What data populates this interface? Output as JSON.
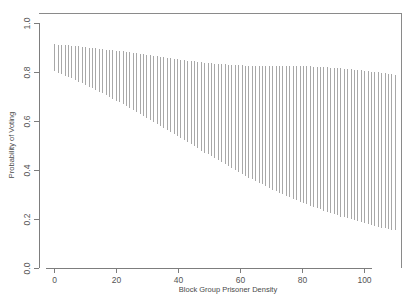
{
  "chart_data": {
    "type": "line",
    "render_style": "vertical-interval-bars",
    "title": "",
    "subtitle": "",
    "xlabel": "Block Group Prisoner Density",
    "ylabel": "Probability of Voting",
    "xlim": [
      -5,
      112
    ],
    "ylim": [
      0.0,
      1.04
    ],
    "grid": false,
    "legend": null,
    "annotations": [],
    "xticks": [
      0,
      20,
      40,
      60,
      80,
      100
    ],
    "xtick_labels": [
      "0",
      "20",
      "40",
      "60",
      "80",
      "100"
    ],
    "yticks": [
      0.0,
      0.2,
      0.4,
      0.6,
      0.8,
      1.0
    ],
    "ytick_labels": [
      "0.0",
      "0.2",
      "0.4",
      "0.6",
      "0.8",
      "1.0"
    ],
    "series": [
      {
        "name": "upper",
        "x": [
          0.0,
          1.1,
          2.2,
          3.3,
          4.4,
          5.5,
          6.6,
          7.7,
          8.8,
          9.9,
          11.0,
          12.1,
          13.2,
          14.3,
          15.4,
          16.5,
          17.6,
          18.7,
          19.8,
          20.9,
          22.0,
          23.1,
          24.2,
          25.3,
          26.4,
          27.5,
          28.6,
          29.7,
          30.8,
          31.9,
          33.0,
          34.1,
          35.2,
          36.3,
          37.4,
          38.5,
          39.6,
          40.7,
          41.8,
          42.9,
          44.0,
          45.1,
          46.2,
          47.3,
          48.4,
          49.5,
          50.6,
          51.7,
          52.8,
          53.9,
          55.0,
          56.1,
          57.2,
          58.3,
          59.4,
          60.5,
          61.6,
          62.7,
          63.8,
          64.9,
          66.0,
          67.1,
          68.2,
          69.3,
          70.4,
          71.5,
          72.6,
          73.7,
          74.8,
          75.9,
          77.0,
          78.1,
          79.2,
          80.3,
          81.4,
          82.5,
          83.6,
          84.7,
          85.8,
          86.9,
          88.0,
          89.1,
          90.2,
          91.3,
          92.4,
          93.5,
          94.6,
          95.7,
          96.8,
          97.9,
          99.0,
          100.1,
          101.2,
          102.3,
          103.4,
          104.5,
          105.6,
          106.7,
          107.8,
          108.9,
          110.0
        ],
        "values": [
          0.912,
          0.911,
          0.91,
          0.909,
          0.908,
          0.906,
          0.905,
          0.904,
          0.902,
          0.901,
          0.899,
          0.898,
          0.896,
          0.895,
          0.893,
          0.891,
          0.89,
          0.888,
          0.886,
          0.885,
          0.883,
          0.881,
          0.879,
          0.877,
          0.876,
          0.874,
          0.872,
          0.87,
          0.868,
          0.866,
          0.864,
          0.862,
          0.86,
          0.858,
          0.856,
          0.854,
          0.852,
          0.85,
          0.848,
          0.846,
          0.845,
          0.843,
          0.841,
          0.839,
          0.838,
          0.836,
          0.835,
          0.833,
          0.832,
          0.831,
          0.83,
          0.829,
          0.828,
          0.827,
          0.826,
          0.826,
          0.825,
          0.825,
          0.824,
          0.824,
          0.824,
          0.824,
          0.824,
          0.824,
          0.824,
          0.824,
          0.824,
          0.824,
          0.824,
          0.824,
          0.824,
          0.823,
          0.823,
          0.823,
          0.822,
          0.822,
          0.821,
          0.82,
          0.82,
          0.819,
          0.818,
          0.817,
          0.816,
          0.815,
          0.814,
          0.813,
          0.811,
          0.81,
          0.809,
          0.807,
          0.806,
          0.804,
          0.803,
          0.801,
          0.8,
          0.798,
          0.796,
          0.795,
          0.793,
          0.791,
          0.789
        ]
      },
      {
        "name": "lower",
        "x": [
          0.0,
          1.1,
          2.2,
          3.3,
          4.4,
          5.5,
          6.6,
          7.7,
          8.8,
          9.9,
          11.0,
          12.1,
          13.2,
          14.3,
          15.4,
          16.5,
          17.6,
          18.7,
          19.8,
          20.9,
          22.0,
          23.1,
          24.2,
          25.3,
          26.4,
          27.5,
          28.6,
          29.7,
          30.8,
          31.9,
          33.0,
          34.1,
          35.2,
          36.3,
          37.4,
          38.5,
          39.6,
          40.7,
          41.8,
          42.9,
          44.0,
          45.1,
          46.2,
          47.3,
          48.4,
          49.5,
          50.6,
          51.7,
          52.8,
          53.9,
          55.0,
          56.1,
          57.2,
          58.3,
          59.4,
          60.5,
          61.6,
          62.7,
          63.8,
          64.9,
          66.0,
          67.1,
          68.2,
          69.3,
          70.4,
          71.5,
          72.6,
          73.7,
          74.8,
          75.9,
          77.0,
          78.1,
          79.2,
          80.3,
          81.4,
          82.5,
          83.6,
          84.7,
          85.8,
          86.9,
          88.0,
          89.1,
          90.2,
          91.3,
          92.4,
          93.5,
          94.6,
          95.7,
          96.8,
          97.9,
          99.0,
          100.1,
          101.2,
          102.3,
          103.4,
          104.5,
          105.6,
          106.7,
          107.8,
          108.9,
          110.0
        ],
        "values": [
          0.803,
          0.797,
          0.791,
          0.785,
          0.779,
          0.773,
          0.766,
          0.76,
          0.753,
          0.747,
          0.74,
          0.733,
          0.726,
          0.719,
          0.712,
          0.705,
          0.698,
          0.69,
          0.683,
          0.675,
          0.668,
          0.66,
          0.652,
          0.644,
          0.636,
          0.628,
          0.62,
          0.612,
          0.604,
          0.596,
          0.588,
          0.579,
          0.571,
          0.563,
          0.554,
          0.546,
          0.538,
          0.529,
          0.521,
          0.513,
          0.504,
          0.496,
          0.488,
          0.479,
          0.471,
          0.463,
          0.455,
          0.447,
          0.439,
          0.431,
          0.423,
          0.415,
          0.407,
          0.399,
          0.392,
          0.384,
          0.377,
          0.369,
          0.362,
          0.355,
          0.348,
          0.341,
          0.334,
          0.327,
          0.32,
          0.314,
          0.307,
          0.301,
          0.295,
          0.289,
          0.283,
          0.277,
          0.271,
          0.265,
          0.26,
          0.254,
          0.249,
          0.244,
          0.239,
          0.234,
          0.229,
          0.224,
          0.219,
          0.215,
          0.21,
          0.206,
          0.202,
          0.198,
          0.194,
          0.19,
          0.186,
          0.182,
          0.179,
          0.175,
          0.172,
          0.168,
          0.165,
          0.162,
          0.159,
          0.156,
          0.153
        ]
      }
    ]
  }
}
